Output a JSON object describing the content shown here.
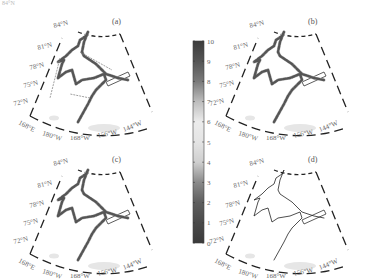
{
  "corner_text": "84°N",
  "chart_data": {
    "type": "map",
    "title": "",
    "projection": "polar stereographic (sector)",
    "lat_labels": [
      "84°N",
      "81°N",
      "78°N",
      "75°N",
      "72°N"
    ],
    "lon_labels": [
      "168°E",
      "180°W",
      "168°W",
      "156°W",
      "144°W"
    ],
    "panels": [
      {
        "id": "a",
        "label": "(a)",
        "style": "colored-with-arrows"
      },
      {
        "id": "b",
        "label": "(b)",
        "style": "colored"
      },
      {
        "id": "c",
        "label": "(c)",
        "style": "colored"
      },
      {
        "id": "d",
        "label": "(d)",
        "style": "black-line"
      }
    ],
    "colorbar": {
      "min": 0,
      "max": 10,
      "ticks": [
        "0",
        "1",
        "2",
        "3",
        "4",
        "5",
        "6",
        "7",
        "8",
        "9",
        "10"
      ],
      "colormap": "grayscale dark-light-dark",
      "colors": [
        "#3a3a3a",
        "#4a4a4a",
        "#5e5e5e",
        "#8a8a8a",
        "#cfcfcf",
        "#e4e4e4",
        "#ececec",
        "#bdbdbd",
        "#7a7a7a",
        "#555555",
        "#3c3c3c"
      ]
    },
    "track_color": "#555555",
    "land_color": "#e6e6e6"
  }
}
